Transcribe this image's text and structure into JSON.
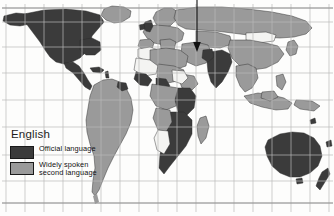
{
  "figure": {
    "name": "world-map-english-language-distribution",
    "width": 334,
    "height": 216,
    "background_color": "#fdfdfc"
  },
  "legend": {
    "title": "English",
    "entries": [
      {
        "label": "Official language",
        "color": "#3b3b3b",
        "swatch_name": "official-language-swatch"
      },
      {
        "label": "Widely spoken\nsecond language",
        "color": "#9a9a9a",
        "swatch_name": "second-language-swatch"
      }
    ]
  },
  "map": {
    "grid": {
      "visible": true,
      "color": "#b9b9b9",
      "vertical_lines": [
        6,
        25,
        44,
        63,
        82,
        101,
        120,
        139,
        158,
        177,
        196,
        215,
        234,
        253,
        272,
        291,
        310,
        329
      ],
      "horizontal_lines": [
        8,
        22,
        47,
        73,
        100,
        127,
        155,
        181,
        203
      ],
      "frame_color": "#8d8d8d"
    },
    "colors": {
      "official": "#3b3b3b",
      "second": "#9a9a9a",
      "none": "#f4f4f2",
      "outline": "#2a2a2a",
      "ocean": "#fdfdfc"
    },
    "regions_official": [
      "North America",
      "United Kingdom",
      "Ireland",
      "India",
      "Pakistan",
      "South Africa",
      "Namibia",
      "Botswana",
      "Zimbabwe",
      "Zambia",
      "Kenya",
      "Nigeria",
      "Ghana",
      "Liberia",
      "Sierra Leone",
      "Australia",
      "New Zealand"
    ],
    "regions_second": [
      "South America",
      "Europe",
      "Russia",
      "China",
      "Southeast Asia",
      "North Africa",
      "Central Africa",
      "Middle East",
      "Greenland",
      "Japan"
    ]
  },
  "annotation": {
    "arrow": {
      "name": "pointer-arrow",
      "color": "#101010",
      "x": 197,
      "y_start": 0,
      "y_end": 51,
      "points_to": "Middle East"
    }
  }
}
